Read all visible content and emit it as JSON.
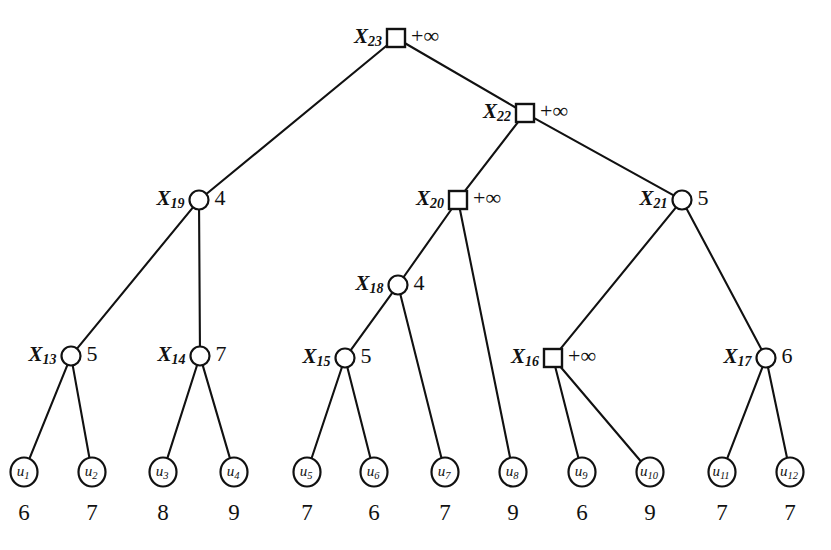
{
  "figure": {
    "background_color": "#ffffff",
    "stroke_color": "#111111",
    "infinity_label": "+∞"
  },
  "chart_data": {
    "type": "diagram",
    "nodes": [
      {
        "id": "X23",
        "name_base": "X",
        "name_sub": "23",
        "shape": "square",
        "value": "+∞",
        "x": 396,
        "y": 38,
        "label_side": "left",
        "value_side": "right"
      },
      {
        "id": "X22",
        "name_base": "X",
        "name_sub": "22",
        "shape": "square",
        "value": "+∞",
        "x": 525,
        "y": 113,
        "label_side": "left",
        "value_side": "right"
      },
      {
        "id": "X19",
        "name_base": "X",
        "name_sub": "19",
        "shape": "circle",
        "value": "4",
        "x": 199,
        "y": 200,
        "label_side": "left",
        "value_side": "right"
      },
      {
        "id": "X20",
        "name_base": "X",
        "name_sub": "20",
        "shape": "square",
        "value": "+∞",
        "x": 458,
        "y": 200,
        "label_side": "left",
        "value_side": "right"
      },
      {
        "id": "X21",
        "name_base": "X",
        "name_sub": "21",
        "shape": "circle",
        "value": "5",
        "x": 682,
        "y": 200,
        "label_side": "left",
        "value_side": "right"
      },
      {
        "id": "X18",
        "name_base": "X",
        "name_sub": "18",
        "shape": "circle",
        "value": "4",
        "x": 398,
        "y": 285,
        "label_side": "left",
        "value_side": "right"
      },
      {
        "id": "X13",
        "name_base": "X",
        "name_sub": "13",
        "shape": "circle",
        "value": "5",
        "x": 71,
        "y": 356,
        "label_side": "left",
        "value_side": "right"
      },
      {
        "id": "X14",
        "name_base": "X",
        "name_sub": "14",
        "shape": "circle",
        "value": "7",
        "x": 200,
        "y": 356,
        "label_side": "left",
        "value_side": "right"
      },
      {
        "id": "X15",
        "name_base": "X",
        "name_sub": "15",
        "shape": "circle",
        "value": "5",
        "x": 345,
        "y": 358,
        "label_side": "left",
        "value_side": "right"
      },
      {
        "id": "X16",
        "name_base": "X",
        "name_sub": "16",
        "shape": "square",
        "value": "+∞",
        "x": 553,
        "y": 358,
        "label_side": "left",
        "value_side": "right"
      },
      {
        "id": "X17",
        "name_base": "X",
        "name_sub": "17",
        "shape": "circle",
        "value": "6",
        "x": 766,
        "y": 358,
        "label_side": "left",
        "value_side": "right"
      }
    ],
    "leaves": [
      {
        "id": "u1",
        "name_base": "u",
        "name_sub": "1",
        "payoff": "6",
        "x": 24,
        "y": 472
      },
      {
        "id": "u2",
        "name_base": "u",
        "name_sub": "2",
        "payoff": "7",
        "x": 92,
        "y": 472
      },
      {
        "id": "u3",
        "name_base": "u",
        "name_sub": "3",
        "payoff": "8",
        "x": 163,
        "y": 472
      },
      {
        "id": "u4",
        "name_base": "u",
        "name_sub": "4",
        "payoff": "9",
        "x": 234,
        "y": 472
      },
      {
        "id": "u5",
        "name_base": "u",
        "name_sub": "5",
        "payoff": "7",
        "x": 307,
        "y": 472
      },
      {
        "id": "u6",
        "name_base": "u",
        "name_sub": "6",
        "payoff": "6",
        "x": 374,
        "y": 472
      },
      {
        "id": "u7",
        "name_base": "u",
        "name_sub": "7",
        "payoff": "7",
        "x": 445,
        "y": 472
      },
      {
        "id": "u8",
        "name_base": "u",
        "name_sub": "8",
        "payoff": "9",
        "x": 513,
        "y": 472
      },
      {
        "id": "u9",
        "name_base": "u",
        "name_sub": "9",
        "payoff": "6",
        "x": 582,
        "y": 472
      },
      {
        "id": "u10",
        "name_base": "u",
        "name_sub": "10",
        "payoff": "9",
        "x": 650,
        "y": 472
      },
      {
        "id": "u11",
        "name_base": "u",
        "name_sub": "11",
        "payoff": "7",
        "x": 722,
        "y": 472
      },
      {
        "id": "u12",
        "name_base": "u",
        "name_sub": "12",
        "payoff": "7",
        "x": 790,
        "y": 472
      }
    ],
    "edges": [
      {
        "from": "X23",
        "to": "X19"
      },
      {
        "from": "X23",
        "to": "X22"
      },
      {
        "from": "X22",
        "to": "X20"
      },
      {
        "from": "X22",
        "to": "X21"
      },
      {
        "from": "X19",
        "to": "X13"
      },
      {
        "from": "X19",
        "to": "X14"
      },
      {
        "from": "X20",
        "to": "X18"
      },
      {
        "from": "X20",
        "to": "u8"
      },
      {
        "from": "X21",
        "to": "X16"
      },
      {
        "from": "X21",
        "to": "X17"
      },
      {
        "from": "X18",
        "to": "X15"
      },
      {
        "from": "X18",
        "to": "u7"
      },
      {
        "from": "X13",
        "to": "u1"
      },
      {
        "from": "X13",
        "to": "u2"
      },
      {
        "from": "X14",
        "to": "u3"
      },
      {
        "from": "X14",
        "to": "u4"
      },
      {
        "from": "X15",
        "to": "u5"
      },
      {
        "from": "X15",
        "to": "u6"
      },
      {
        "from": "X16",
        "to": "u9"
      },
      {
        "from": "X16",
        "to": "u10"
      },
      {
        "from": "X17",
        "to": "u11"
      },
      {
        "from": "X17",
        "to": "u12"
      }
    ]
  }
}
